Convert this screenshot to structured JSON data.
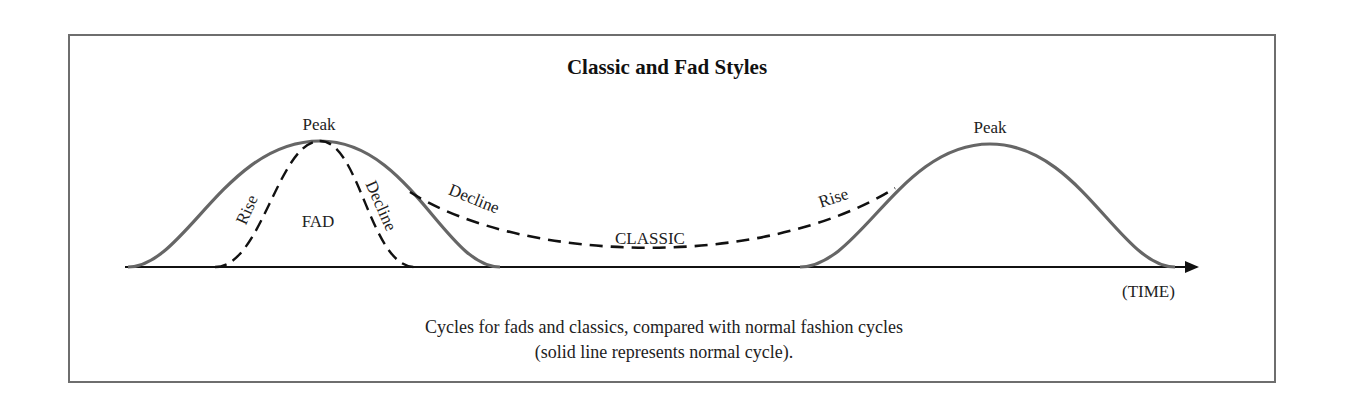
{
  "figure": {
    "title": "Classic and Fad Styles",
    "caption_line1": "Cycles for fads and classics, compared with normal fashion cycles",
    "caption_line2": "(solid line represents normal cycle).",
    "axis_label": "(TIME)"
  },
  "labels": {
    "peak_left": "Peak",
    "peak_right": "Peak",
    "fad_rise": "Rise",
    "fad": "FAD",
    "fad_decline": "Decline",
    "classic_decline": "Decline",
    "classic": "CLASSIC",
    "classic_rise": "Rise"
  },
  "colors": {
    "solid_curve": "#666666",
    "dashed_curve": "#111111",
    "axis": "#111111",
    "frame": "#6e6e6e"
  },
  "legend": {
    "solid": "normal cycle",
    "dashed": "fad / classic cycle"
  }
}
